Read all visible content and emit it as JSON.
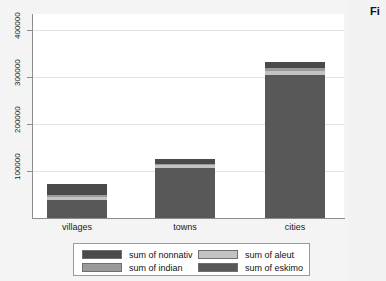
{
  "side_note": "Fi",
  "chart_data": {
    "type": "bar",
    "subtype": "stacked",
    "title": "",
    "xlabel": "",
    "ylabel": "",
    "categories": [
      "villages",
      "towns",
      "cities"
    ],
    "ylim": [
      0,
      450000
    ],
    "yticks": [
      100000,
      200000,
      300000,
      400000
    ],
    "ytick_labels": [
      "100000",
      "200000",
      "300000",
      "400000"
    ],
    "grid": true,
    "legend_position": "bottom",
    "series": [
      {
        "name": "sum of eskimo",
        "color": "#585858",
        "values": [
          40000,
          110000,
          315000
        ]
      },
      {
        "name": "sum of aleut",
        "color": "#c3c3c3",
        "values": [
          6000,
          6000,
          9000
        ]
      },
      {
        "name": "sum of indian",
        "color": "#9a9a9a",
        "values": [
          4000,
          4000,
          6000
        ]
      },
      {
        "name": "sum of nonnativ",
        "color": "#4a4a4a",
        "values": [
          25000,
          10000,
          15000
        ]
      }
    ],
    "totals": [
      75000,
      130000,
      345000
    ],
    "legend_entries": [
      {
        "label": "sum of nonnativ",
        "color": "#4a4a4a"
      },
      {
        "label": "sum of aleut",
        "color": "#c3c3c3"
      },
      {
        "label": "sum of indian",
        "color": "#9a9a9a"
      },
      {
        "label": "sum of eskimo",
        "color": "#585858"
      }
    ]
  }
}
